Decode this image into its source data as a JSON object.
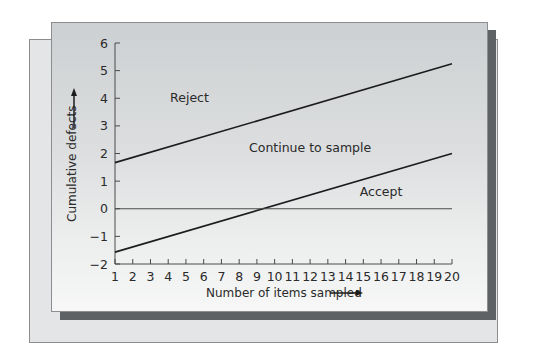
{
  "chart_data": {
    "type": "line",
    "title": "",
    "xlabel": "Number of items sampled",
    "ylabel": "Cumulative defects",
    "x_ticks": [
      1,
      2,
      3,
      4,
      5,
      6,
      7,
      8,
      9,
      10,
      11,
      12,
      13,
      14,
      15,
      16,
      17,
      18,
      19,
      20
    ],
    "y_ticks": [
      -2,
      -1,
      0,
      1,
      2,
      3,
      4,
      5,
      6
    ],
    "xlim": [
      1,
      20
    ],
    "ylim": [
      -2,
      6
    ],
    "grid": false,
    "legend": "none",
    "series": [
      {
        "name": "Reject limit line",
        "x": [
          1,
          20
        ],
        "values": [
          1.67,
          5.25
        ]
      },
      {
        "name": "Accept limit line",
        "x": [
          1,
          20
        ],
        "values": [
          -1.57,
          2.0
        ]
      },
      {
        "name": "Zero reference",
        "x": [
          1,
          20
        ],
        "values": [
          0,
          0
        ]
      }
    ],
    "annotations": [
      {
        "text": "Reject",
        "x": 5.2,
        "y": 4.0
      },
      {
        "text": "Continue to sample",
        "x": 12.0,
        "y": 2.2
      },
      {
        "text": "Accept",
        "x": 16.0,
        "y": 0.6
      }
    ]
  },
  "labels": {
    "xlabel": "Number of items sampled",
    "ylabel": "Cumulative defects",
    "reject": "Reject",
    "continue": "Continue to sample",
    "accept": "Accept"
  },
  "colors": {
    "line": "#1c1c1e",
    "axis": "#4a4a4a",
    "shadow": "#5f6264"
  }
}
